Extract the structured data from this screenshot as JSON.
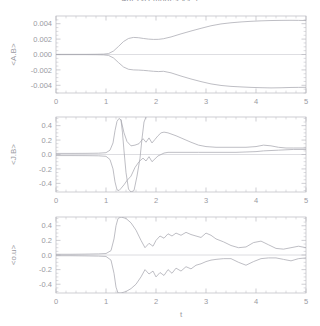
{
  "figure": {
    "title": "4pi 2-D modes vs. t",
    "width": 320,
    "height": 326,
    "background": "#ffffff",
    "axis_color": "#b9b9c0",
    "curve_color": "#a8a8b0",
    "text_color": "#9a9aa2",
    "xlabel": "t"
  },
  "chart_data": [
    {
      "type": "line",
      "panel": 1,
      "title": "",
      "xlabel": "",
      "ylabel": "<A.B>",
      "xlim": [
        0,
        5
      ],
      "ylim": [
        -0.005,
        0.005
      ],
      "xticks": [
        0,
        1,
        2,
        3,
        4,
        5
      ],
      "xticklabels": [
        "0",
        "1",
        "2",
        "3",
        "4",
        "5"
      ],
      "yticks": [
        -0.004,
        -0.002,
        0.0,
        0.002,
        0.004
      ],
      "yticklabels": [
        "-0.004",
        "-0.002",
        "0.000",
        "0.002",
        "0.004"
      ],
      "grid": false,
      "legend": "none",
      "series": [
        {
          "name": "upper-branch",
          "x": [
            0.0,
            0.2,
            0.4,
            0.6,
            0.8,
            0.95,
            1.05,
            1.15,
            1.25,
            1.35,
            1.45,
            1.55,
            1.65,
            1.75,
            1.85,
            1.95,
            2.05,
            2.15,
            2.3,
            2.5,
            2.7,
            2.9,
            3.1,
            3.3,
            3.5,
            3.7,
            3.9,
            4.1,
            4.3,
            4.5,
            4.7,
            4.85,
            5.0
          ],
          "values": [
            2e-05,
            2e-05,
            2e-05,
            2e-05,
            3e-05,
            5e-05,
            0.00012,
            0.00045,
            0.00105,
            0.00168,
            0.00208,
            0.00222,
            0.00218,
            0.00208,
            0.002,
            0.00196,
            0.00197,
            0.00205,
            0.00228,
            0.00268,
            0.00305,
            0.0034,
            0.00373,
            0.00397,
            0.00412,
            0.00423,
            0.00431,
            0.00437,
            0.00441,
            0.00443,
            0.00444,
            0.00443,
            0.00441
          ]
        },
        {
          "name": "lower-branch",
          "x": [
            0.0,
            0.2,
            0.4,
            0.6,
            0.8,
            0.95,
            1.05,
            1.15,
            1.25,
            1.35,
            1.45,
            1.55,
            1.65,
            1.75,
            1.85,
            1.95,
            2.05,
            2.15,
            2.3,
            2.5,
            2.7,
            2.9,
            3.1,
            3.3,
            3.5,
            3.7,
            3.9,
            4.1,
            4.3,
            4.5,
            4.7,
            4.85,
            5.0
          ],
          "values": [
            -2e-05,
            -2e-05,
            -2e-05,
            -2e-05,
            -3e-05,
            -5e-05,
            -0.00012,
            -0.00045,
            -0.00105,
            -0.00162,
            -0.00192,
            -0.002,
            -0.00202,
            -0.00206,
            -0.00212,
            -0.00218,
            -0.00222,
            -0.00218,
            -0.00238,
            -0.0028,
            -0.00318,
            -0.00352,
            -0.00382,
            -0.00402,
            -0.00414,
            -0.00421,
            -0.00427,
            -0.00431,
            -0.00434,
            -0.00432,
            -0.00428,
            -0.00427,
            -0.00426
          ]
        }
      ]
    },
    {
      "type": "line",
      "panel": 2,
      "title": "",
      "xlabel": "",
      "ylabel": "<J.B>",
      "xlim": [
        0,
        5
      ],
      "ylim": [
        -0.52,
        0.52
      ],
      "xticks": [
        0,
        1,
        2,
        3,
        4,
        5
      ],
      "xticklabels": [
        "0",
        "1",
        "2",
        "3",
        "4",
        "5"
      ],
      "yticks": [
        -0.4,
        -0.2,
        0.0,
        0.2,
        0.4
      ],
      "yticklabels": [
        "-0.4",
        "-0.2",
        "0.0",
        "0.2",
        "0.4"
      ],
      "grid": false,
      "legend": "none",
      "series": [
        {
          "name": "upper-branch",
          "x": [
            0.0,
            0.3,
            0.6,
            0.85,
            1.0,
            1.08,
            1.14,
            1.18,
            1.22,
            1.26,
            1.3,
            1.36,
            1.42,
            1.5,
            1.58,
            1.66,
            1.74,
            1.8,
            1.86,
            1.92,
            1.98,
            2.04,
            2.1,
            2.16,
            2.24,
            2.32,
            2.4,
            2.5,
            2.6,
            2.7,
            2.85,
            3.0,
            3.2,
            3.4,
            3.6,
            3.8,
            4.0,
            4.15,
            4.3,
            4.45,
            4.6,
            4.75,
            4.9,
            5.0
          ],
          "values": [
            0.015,
            0.015,
            0.016,
            0.018,
            0.025,
            0.06,
            0.16,
            0.33,
            0.46,
            0.5,
            0.48,
            0.3,
            0.18,
            0.12,
            0.13,
            0.15,
            0.22,
            0.17,
            0.23,
            0.16,
            0.21,
            0.26,
            0.3,
            0.31,
            0.3,
            0.28,
            0.26,
            0.23,
            0.2,
            0.17,
            0.13,
            0.11,
            0.1,
            0.1,
            0.1,
            0.1,
            0.11,
            0.13,
            0.12,
            0.1,
            0.09,
            0.09,
            0.09,
            0.09
          ]
        },
        {
          "name": "lower-branch",
          "x": [
            0.0,
            0.3,
            0.6,
            0.85,
            1.0,
            1.08,
            1.14,
            1.18,
            1.22,
            1.26,
            1.3,
            1.36,
            1.42,
            1.5,
            1.58,
            1.66,
            1.74,
            1.8,
            1.86,
            1.92,
            1.98,
            2.04,
            2.1,
            2.16,
            2.24,
            2.32,
            2.4,
            2.5,
            2.6,
            2.7,
            2.85,
            3.0,
            3.2,
            3.4,
            3.6,
            3.8,
            4.0,
            4.15,
            4.3,
            4.45,
            4.6,
            4.75,
            4.9,
            5.0
          ],
          "values": [
            -0.015,
            -0.015,
            -0.016,
            -0.018,
            -0.025,
            -0.07,
            -0.2,
            -0.38,
            -0.49,
            -0.5,
            -0.47,
            -0.42,
            -0.36,
            -0.3,
            -0.18,
            -0.1,
            -0.05,
            -0.09,
            -0.03,
            -0.1,
            -0.06,
            -0.02,
            0.0,
            0.02,
            0.03,
            0.03,
            0.03,
            0.03,
            0.03,
            0.03,
            0.03,
            0.03,
            0.03,
            0.03,
            0.03,
            0.035,
            0.04,
            0.05,
            0.055,
            0.06,
            0.065,
            0.07,
            0.07,
            0.07
          ]
        },
        {
          "name": "spike-down",
          "x": [
            1.3,
            1.33,
            1.36,
            1.4,
            1.45,
            1.5,
            1.56,
            1.62,
            1.68,
            1.72,
            1.76,
            1.8
          ],
          "values": [
            0.48,
            0.3,
            0.05,
            -0.25,
            -0.48,
            -0.52,
            -0.5,
            -0.3,
            -0.05,
            0.22,
            0.45,
            0.52
          ]
        }
      ]
    },
    {
      "type": "line",
      "panel": 3,
      "title": "",
      "xlabel": "t",
      "ylabel": "<o.u>",
      "xlim": [
        0,
        5
      ],
      "ylim": [
        -0.52,
        0.52
      ],
      "xticks": [
        0,
        1,
        2,
        3,
        4,
        5
      ],
      "xticklabels": [
        "0",
        "1",
        "2",
        "3",
        "4",
        "5"
      ],
      "yticks": [
        -0.4,
        -0.2,
        0.0,
        0.2,
        0.4
      ],
      "yticklabels": [
        "-0.4",
        "-0.2",
        "0.0",
        "0.2",
        "0.4"
      ],
      "grid": false,
      "legend": "none",
      "series": [
        {
          "name": "upper-branch",
          "x": [
            0.0,
            0.3,
            0.6,
            0.85,
            1.0,
            1.1,
            1.16,
            1.2,
            1.24,
            1.3,
            1.4,
            1.5,
            1.6,
            1.7,
            1.78,
            1.86,
            1.94,
            2.0,
            2.08,
            2.16,
            2.24,
            2.32,
            2.4,
            2.5,
            2.6,
            2.7,
            2.8,
            2.9,
            3.0,
            3.1,
            3.2,
            3.35,
            3.5,
            3.65,
            3.8,
            3.95,
            4.1,
            4.25,
            4.4,
            4.55,
            4.7,
            4.85,
            5.0
          ],
          "values": [
            0.01,
            0.01,
            0.012,
            0.015,
            0.02,
            0.06,
            0.22,
            0.4,
            0.5,
            0.52,
            0.5,
            0.44,
            0.34,
            0.2,
            0.1,
            0.16,
            0.12,
            0.2,
            0.26,
            0.23,
            0.29,
            0.26,
            0.3,
            0.27,
            0.31,
            0.28,
            0.26,
            0.24,
            0.3,
            0.27,
            0.22,
            0.18,
            0.13,
            0.1,
            0.11,
            0.17,
            0.19,
            0.14,
            0.09,
            0.08,
            0.1,
            0.12,
            0.1
          ]
        },
        {
          "name": "lower-branch",
          "x": [
            0.0,
            0.3,
            0.6,
            0.85,
            1.0,
            1.1,
            1.16,
            1.2,
            1.24,
            1.3,
            1.4,
            1.5,
            1.6,
            1.7,
            1.78,
            1.86,
            1.94,
            2.0,
            2.08,
            2.16,
            2.24,
            2.32,
            2.4,
            2.5,
            2.6,
            2.7,
            2.8,
            2.9,
            3.0,
            3.1,
            3.2,
            3.35,
            3.5,
            3.65,
            3.8,
            3.95,
            4.1,
            4.25,
            4.4,
            4.55,
            4.7,
            4.85,
            5.0
          ],
          "values": [
            -0.01,
            -0.01,
            -0.012,
            -0.015,
            -0.02,
            -0.07,
            -0.25,
            -0.44,
            -0.52,
            -0.52,
            -0.5,
            -0.46,
            -0.4,
            -0.3,
            -0.2,
            -0.26,
            -0.22,
            -0.3,
            -0.24,
            -0.28,
            -0.2,
            -0.25,
            -0.18,
            -0.22,
            -0.16,
            -0.19,
            -0.14,
            -0.12,
            -0.09,
            -0.07,
            -0.06,
            -0.05,
            -0.05,
            -0.1,
            -0.14,
            -0.09,
            -0.05,
            -0.04,
            -0.04,
            -0.06,
            -0.08,
            -0.05,
            -0.04
          ]
        }
      ]
    }
  ]
}
